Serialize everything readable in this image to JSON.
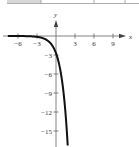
{
  "chart_data": {
    "type": "line",
    "title": "",
    "xlabel": "x",
    "ylabel": "y",
    "function": "y = -e^(x+1)",
    "xlim": [
      -8,
      11.5
    ],
    "ylim": [
      -17.5,
      3.5
    ],
    "x_ticks": [
      -6,
      -3,
      3,
      6,
      9
    ],
    "y_ticks": [
      -3,
      -6,
      -9,
      -12,
      -15
    ],
    "x_tick_labels": [
      "−6",
      "−3",
      "3",
      "6",
      "9"
    ],
    "y_tick_labels": [
      "−3",
      "−6",
      "−9",
      "−12",
      "−15"
    ],
    "series": [
      {
        "name": "curve",
        "x": [
          -7.5,
          -6,
          -5,
          -4,
          -3,
          -2,
          -1,
          0,
          0.5,
          1,
          1.5,
          1.8
        ],
        "y": [
          -0.003,
          -0.007,
          -0.018,
          -0.05,
          -0.135,
          -0.37,
          -1.0,
          -2.72,
          -4.48,
          -7.39,
          -12.18,
          -16.44
        ]
      }
    ],
    "asymptote": "y = 0",
    "grid": false,
    "legend": "none"
  },
  "table_fragment": {
    "shaded_cell_color": "#d8d8d8",
    "border_color": "#999999"
  }
}
